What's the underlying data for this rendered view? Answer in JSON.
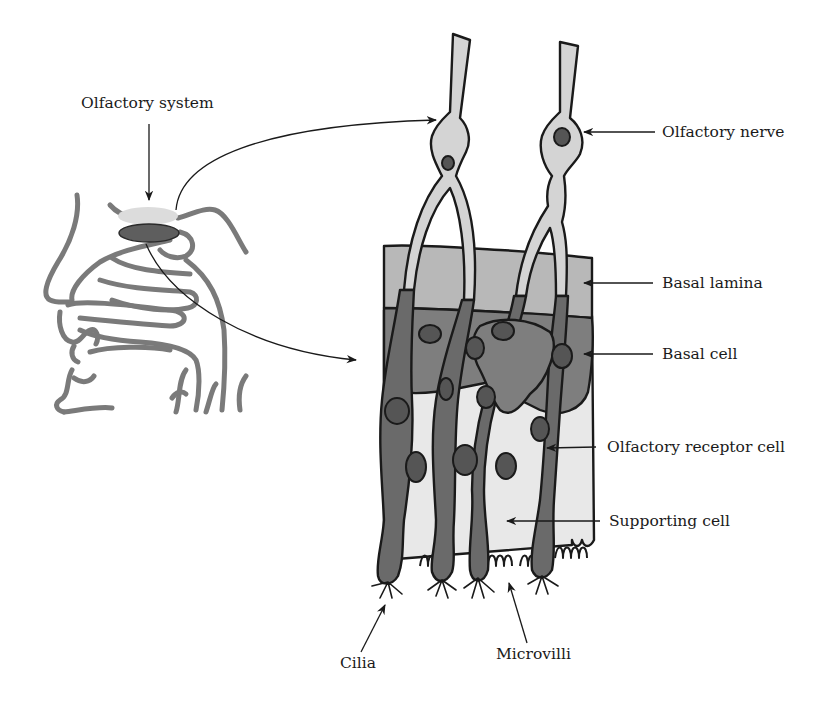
{
  "figure": {
    "colors": {
      "background": "#ffffff",
      "outline": "#1a1a1a",
      "head_line": "#7a7a7a",
      "bulb_light": "#d8d8d8",
      "epithelium_dark": "#5e5e5e",
      "nerve_fill": "#d4d4d4",
      "lamina_fill": "#b8b8b8",
      "basal_fill": "#7e7e7e",
      "receptor_fill": "#6a6a6a",
      "supporting_fill": "#e8e8e8",
      "nucleus_fill": "#555555"
    }
  },
  "labels": {
    "olfactory_system": "Olfactory system",
    "olfactory_nerve": "Olfactory nerve",
    "basal_lamina": "Basal lamina",
    "basal_cell": "Basal cell",
    "olfactory_receptor_cell": "Olfactory receptor cell",
    "supporting_cell": "Supporting cell",
    "cilia": "Cilia",
    "microvilli": "Microvilli"
  }
}
